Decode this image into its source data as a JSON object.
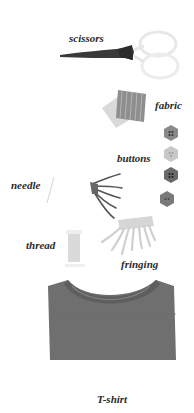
{
  "illustration": {
    "items": [
      {
        "id": "scissors",
        "label": "scissors"
      },
      {
        "id": "fabric",
        "label": "fabric"
      },
      {
        "id": "buttons",
        "label": "buttons"
      },
      {
        "id": "needle",
        "label": "needle"
      },
      {
        "id": "thread",
        "label": "thread"
      },
      {
        "id": "fringing",
        "label": "fringing"
      },
      {
        "id": "tshirt",
        "label": "T-shirt"
      }
    ],
    "colors": {
      "background": "#ffffff",
      "label_text": "#2a2a2a",
      "scissors_blade": "#3a3a3a",
      "scissors_handle": "#ececec",
      "fabric": "#9a9a9a",
      "button_dark": "#6e6e6e",
      "button_light": "#c8c8c8",
      "tshirt": "#6f6f6f"
    }
  }
}
